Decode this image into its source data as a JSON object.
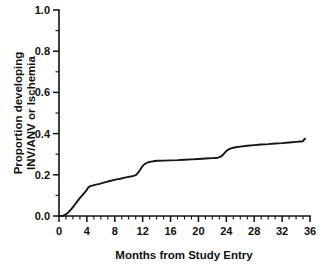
{
  "chart_data": {
    "type": "line",
    "title": "",
    "subtitle": "",
    "xlabel": "Months from Study Entry",
    "ylabel": "Proportion developing INV/ANV or Ischemia",
    "ylabel_line1": "Proportion developing",
    "ylabel_line2": "INV/ANV or Ischemia",
    "xlim": [
      0,
      36
    ],
    "ylim": [
      0,
      1.0
    ],
    "grid": false,
    "legend": "none",
    "x_major_ticks": [
      0,
      4,
      8,
      12,
      16,
      20,
      24,
      28,
      32,
      36
    ],
    "x_tick_labels": [
      "0",
      "4",
      "8",
      "12",
      "16",
      "20",
      "24",
      "28",
      "32",
      "36"
    ],
    "x_minor_tick_interval": 1,
    "y_major_ticks": [
      0.0,
      0.2,
      0.4,
      0.6,
      0.8,
      1.0
    ],
    "y_tick_labels": [
      "0.0",
      "0.2",
      "0.4",
      "0.6",
      "0.8",
      "1.0"
    ],
    "y_minor_ticks": [
      0.1,
      0.3,
      0.5,
      0.7,
      0.9
    ],
    "line_color": "#151515",
    "axis_color": "#111111",
    "background_color": "#ffffff",
    "series": [
      {
        "name": "Cumulative incidence of INV/ANV or Ischemia",
        "x": [
          0,
          0.6,
          1.0,
          1.4,
          1.8,
          2.2,
          2.6,
          3.0,
          3.4,
          3.7,
          4.0,
          4.2,
          4.5,
          4.9,
          5.3,
          5.8,
          6.3,
          6.8,
          7.3,
          7.8,
          8.3,
          8.8,
          9.3,
          9.8,
          10.3,
          10.7,
          11.0,
          11.3,
          11.6,
          11.9,
          12.2,
          12.5,
          12.8,
          13.2,
          13.6,
          14.0,
          15.0,
          16.0,
          17.0,
          18.0,
          19.0,
          20.0,
          21.0,
          22.0,
          22.8,
          23.2,
          23.6,
          24.0,
          24.4,
          24.8,
          25.4,
          26.0,
          27.0,
          28.0,
          29.0,
          30.0,
          31.0,
          32.0,
          33.0,
          34.0,
          34.6,
          35.0,
          35.2,
          35.4
        ],
        "y": [
          0.0,
          0.002,
          0.008,
          0.02,
          0.035,
          0.052,
          0.07,
          0.088,
          0.103,
          0.115,
          0.128,
          0.138,
          0.145,
          0.149,
          0.152,
          0.156,
          0.161,
          0.166,
          0.17,
          0.174,
          0.178,
          0.181,
          0.185,
          0.189,
          0.192,
          0.195,
          0.198,
          0.208,
          0.222,
          0.238,
          0.25,
          0.256,
          0.261,
          0.264,
          0.266,
          0.268,
          0.269,
          0.27,
          0.271,
          0.273,
          0.275,
          0.277,
          0.279,
          0.281,
          0.283,
          0.288,
          0.3,
          0.315,
          0.325,
          0.33,
          0.334,
          0.337,
          0.341,
          0.344,
          0.347,
          0.349,
          0.352,
          0.354,
          0.357,
          0.36,
          0.362,
          0.363,
          0.374,
          0.375
        ],
        "notes": "Step-like cumulative incidence curve; steep early rise through month 4, plateau near 0.15-0.20 from month 5 to 11, step to ~0.27 around months 11-13, slow plateau to month 23, step to ~0.33 around months 23-25, gradual rise to ~0.375 at month 35"
      }
    ]
  }
}
